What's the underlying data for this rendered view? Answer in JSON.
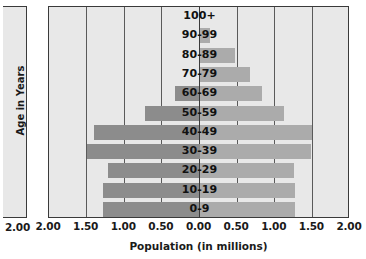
{
  "chart_data": {
    "type": "bar",
    "title": "",
    "xlabel": "Population (in millions)",
    "ylabel": "Age in Years",
    "xlim": [
      -2.0,
      2.0
    ],
    "xticks": [
      "2.00",
      "1.50",
      "1.00",
      "0.50",
      "0.00",
      "0.50",
      "1.00",
      "1.50",
      "2.00"
    ],
    "xtick_values": [
      -2.0,
      -1.5,
      -1.0,
      -0.5,
      0.0,
      0.5,
      1.0,
      1.5,
      2.0
    ],
    "grid": true,
    "legend": "none",
    "orientation": "horizontal-diverging",
    "categories": [
      "100+",
      "90-99",
      "80-89",
      "70-79",
      "60-69",
      "50-59",
      "40-49",
      "30-39",
      "20-29",
      "10-19",
      "0-9"
    ],
    "series": [
      {
        "name": "left",
        "side": "left",
        "color": "#8c8c8c",
        "values": [
          0.0,
          0.0,
          0.0,
          0.0,
          0.33,
          0.73,
          1.4,
          1.5,
          1.22,
          1.28,
          1.28
        ]
      },
      {
        "name": "right",
        "side": "right",
        "color": "#ababab",
        "values": [
          0.0,
          0.14,
          0.47,
          0.67,
          0.83,
          1.12,
          1.5,
          1.48,
          1.25,
          1.27,
          1.27
        ]
      }
    ]
  },
  "side_panel": {
    "axis_label": "2.00"
  }
}
